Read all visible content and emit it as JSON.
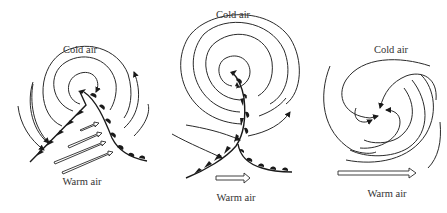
{
  "figure": {
    "panels": [
      {
        "id": "panel-1",
        "stage": "open wave",
        "cold_label": "Cold air",
        "warm_label": "Warm air",
        "warm_sector_arrows": 4
      },
      {
        "id": "panel-2",
        "stage": "occluding",
        "cold_label": "Cold air",
        "warm_label": "Warm air",
        "warm_sector_arrows": 1
      },
      {
        "id": "panel-3",
        "stage": "fully occluded / dissipating",
        "cold_label": "Cold air",
        "warm_label": "Warm air",
        "warm_sector_arrows": 1
      }
    ],
    "colors": {
      "ink": "#1a1a1a",
      "text": "#333333",
      "background": "#ffffff"
    }
  }
}
